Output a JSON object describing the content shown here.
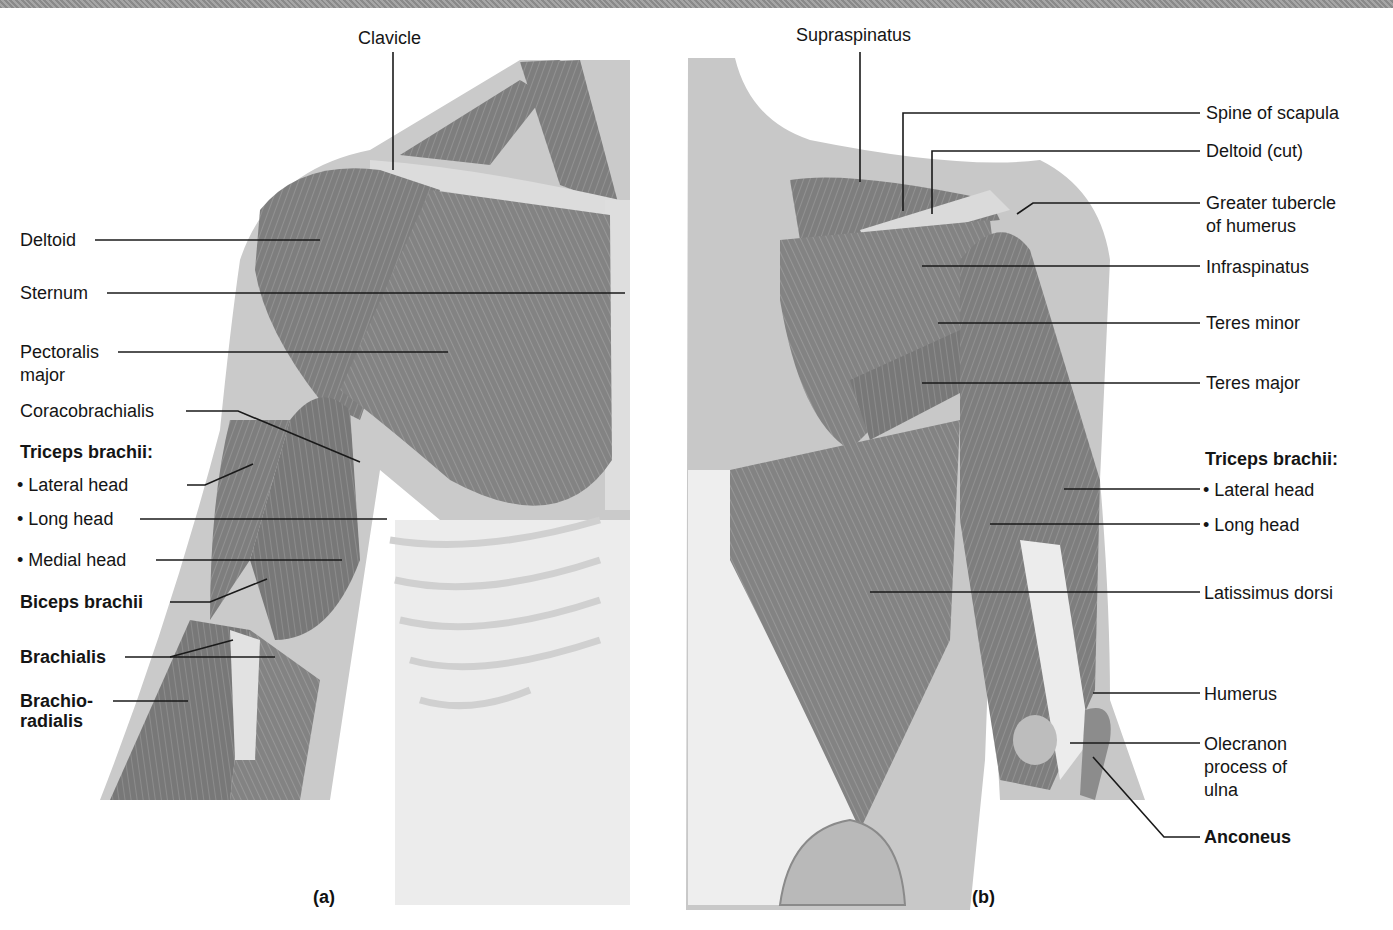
{
  "figure": {
    "top_bar_color": "#999999",
    "panels": [
      {
        "id": "a",
        "label": "(a)",
        "view": "anterior"
      },
      {
        "id": "b",
        "label": "(b)",
        "view": "posterior"
      }
    ]
  },
  "anterior_labels": {
    "clavicle": "Clavicle",
    "deltoid": "Deltoid",
    "sternum": "Sternum",
    "pectoralis_1": "Pectoralis",
    "pectoralis_2": "major",
    "coracobrachialis": "Coracobrachialis",
    "triceps_header": "Triceps brachii:",
    "lateral_head": "• Lateral head",
    "long_head": "• Long head",
    "medial_head": "• Medial head",
    "biceps": "Biceps brachii",
    "brachialis": "Brachialis",
    "brachioradialis_1": "Brachio-",
    "brachioradialis_2": "radialis"
  },
  "posterior_labels": {
    "supraspinatus": "Supraspinatus",
    "spine_of_scapula": "Spine of scapula",
    "deltoid_cut": "Deltoid (cut)",
    "greater_tubercle_1": "Greater tubercle",
    "greater_tubercle_2": "of humerus",
    "infraspinatus": "Infraspinatus",
    "teres_minor": "Teres minor",
    "teres_major": "Teres major",
    "triceps_header": "Triceps brachii:",
    "lateral_head": "• Lateral head",
    "long_head": "• Long head",
    "latissimus": "Latissimus dorsi",
    "humerus": "Humerus",
    "olecranon_1": "Olecranon",
    "olecranon_2": "process of",
    "olecranon_3": "ulna",
    "anconeus": "Anconeus"
  },
  "colors": {
    "muscle": "#7e7e7e",
    "muscle_dark": "#5e5e5e",
    "skin_outline": "#c4c4c4",
    "bone": "#e4e4e4",
    "leader_line": "#1a1a1a"
  }
}
